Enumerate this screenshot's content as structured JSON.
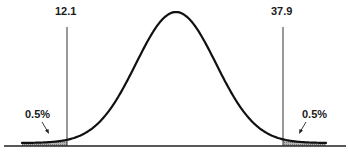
{
  "chart_data": {
    "type": "area",
    "title": "",
    "xlabel": "",
    "ylabel": "",
    "grid": false,
    "critical_values": [
      {
        "label": "12.1",
        "value": 12.1,
        "side": "left"
      },
      {
        "label": "37.9",
        "value": 37.9,
        "side": "right"
      }
    ],
    "tail_areas": [
      {
        "label": "0.5%",
        "value": 0.5,
        "side": "left"
      },
      {
        "label": "0.5%",
        "value": 0.5,
        "side": "right"
      }
    ],
    "mean": 25.0
  },
  "labels": {
    "left_critical": "12.1",
    "right_critical": "37.9",
    "left_tail": "0.5%",
    "right_tail": "0.5%"
  },
  "colors": {
    "curve": "#111111",
    "shade": "#9a9a9a",
    "line": "#333333"
  }
}
